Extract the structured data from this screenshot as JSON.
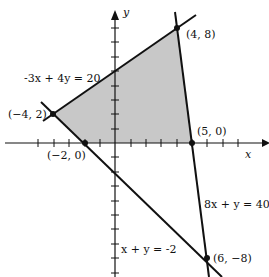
{
  "diagram": {
    "type": "feasible-region-graph",
    "axes": {
      "x_label": "x",
      "y_label": "y"
    },
    "constraints": [
      {
        "id": "line1",
        "equation": "-3x + 4y = 20"
      },
      {
        "id": "line2",
        "equation": "8x + y = 40"
      },
      {
        "id": "line3",
        "equation": "x + y = -2"
      }
    ],
    "vertices": [
      {
        "label": "(−4, 2)",
        "x": -4,
        "y": 2
      },
      {
        "label": "(4, 8)",
        "x": 4,
        "y": 8
      },
      {
        "label": "(5, 0)",
        "x": 5,
        "y": 0
      },
      {
        "label": "(−2, 0)",
        "x": -2,
        "y": 0
      },
      {
        "label": "(6, −8)",
        "x": 6,
        "y": -8
      }
    ],
    "shaded_region": "polygon (−4,2), (4,8), (5,0), (−2,0)",
    "colors": {
      "shade": "#c8c8c8",
      "line": "#111111"
    }
  }
}
